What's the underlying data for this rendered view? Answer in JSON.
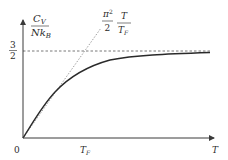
{
  "diagram": {
    "y_axis": {
      "label_numerator": "C",
      "label_numerator_sub": "V",
      "label_denominator": "Nk",
      "label_denominator_sub": "B"
    },
    "x_axis": {
      "label": "T",
      "origin_label": "0",
      "tick_label": "T",
      "tick_label_sub": "F"
    },
    "asymptote": {
      "numerator": "3",
      "denominator": "2",
      "value": 1.5
    },
    "low_t_line": {
      "coef_numerator": "π",
      "coef_numerator_sup": "2",
      "coef_denominator": "2",
      "frac_numerator": "T",
      "frac_denominator": "T",
      "frac_denominator_sub": "F"
    },
    "colors": {
      "axis": "#3a3a3a",
      "curve": "#2a2a2a",
      "dashed": "#555555",
      "dotted": "#888888"
    }
  }
}
